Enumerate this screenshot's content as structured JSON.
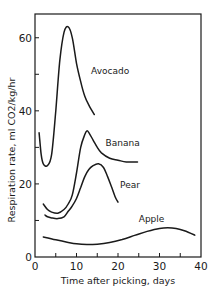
{
  "chart_data": {
    "type": "line",
    "title": "",
    "xlabel": "Time after picking, days",
    "ylabel": "Respiration rate, ml CO2/kg/hr",
    "xlim": [
      0,
      40
    ],
    "ylim": [
      0,
      66.5
    ],
    "x_ticks": [
      0,
      5,
      10,
      15,
      20,
      25,
      30,
      35,
      40
    ],
    "x_tick_labels": [
      "0",
      "10",
      "20",
      "30",
      "40"
    ],
    "x_tick_label_values": [
      0,
      10,
      20,
      30,
      40
    ],
    "y_ticks": [
      0,
      10,
      20,
      30,
      40,
      50,
      60
    ],
    "y_tick_labels": [
      "0",
      "20",
      "40",
      "60"
    ],
    "y_tick_label_values": [
      0,
      20,
      40,
      60
    ],
    "grid": false,
    "legend": "inline labels",
    "line_color": "#1a1a1a",
    "series": [
      {
        "name": "Avocado",
        "label_pos": [
          13.5,
          50
        ],
        "x": [
          1,
          1.5,
          2,
          3,
          4,
          5,
          6,
          7,
          8,
          9,
          10,
          11,
          12,
          13,
          14.3
        ],
        "y": [
          34,
          28,
          25.5,
          25,
          28,
          40,
          54,
          61.5,
          63,
          60,
          53,
          48,
          44,
          41.5,
          39
        ]
      },
      {
        "name": "Banana",
        "label_pos": [
          17,
          30.5
        ],
        "x": [
          2,
          3,
          4,
          5.5,
          7,
          8,
          9,
          10,
          11,
          12,
          12.5,
          13,
          14,
          15,
          16,
          18,
          20,
          22,
          24.7
        ],
        "y": [
          14.5,
          13,
          12.3,
          12,
          13,
          14.5,
          17,
          23,
          30,
          33.5,
          34.5,
          34,
          32,
          30,
          28.5,
          27,
          26.5,
          26,
          26
        ]
      },
      {
        "name": "Pear",
        "label_pos": [
          20.5,
          19
        ],
        "x": [
          2.4,
          3,
          4,
          5.5,
          7,
          8,
          9,
          10,
          11,
          12,
          13,
          14,
          15.3,
          16.5,
          17.5,
          18.5,
          19.3,
          20
        ],
        "y": [
          11.5,
          11,
          10.7,
          10.5,
          11,
          12.5,
          14,
          16,
          19,
          22,
          24,
          25,
          25.5,
          24.5,
          22,
          19,
          16.5,
          15
        ]
      },
      {
        "name": "Apple",
        "label_pos": [
          25,
          9.5
        ],
        "x": [
          2,
          5,
          8,
          10,
          12.5,
          15,
          18,
          21,
          24,
          27,
          30,
          32,
          34,
          36,
          38.5
        ],
        "y": [
          5.5,
          4.7,
          4,
          3.6,
          3.4,
          3.5,
          4,
          4.8,
          5.9,
          7,
          7.8,
          8,
          7.8,
          7.2,
          6
        ]
      }
    ]
  }
}
